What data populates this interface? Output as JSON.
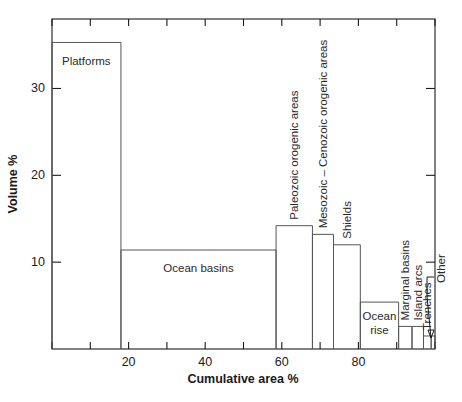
{
  "chart_data": {
    "type": "bar",
    "title": "",
    "xlabel": "Cumulative area %",
    "ylabel": "Volume %",
    "xlim": [
      0,
      100
    ],
    "ylim": [
      0,
      38
    ],
    "xticks": [
      0,
      10,
      20,
      30,
      40,
      50,
      60,
      70,
      80,
      90,
      100
    ],
    "xtick_labels": [
      "",
      "",
      "20",
      "",
      "40",
      "",
      "60",
      "",
      "80",
      "",
      ""
    ],
    "yticks": [
      10,
      20,
      30
    ],
    "ytick_labels": [
      "10",
      "20",
      "30"
    ],
    "grid": false,
    "legend": "none",
    "note": "Step histogram: bar width = cumulative area span, bar height = volume %",
    "bars": [
      {
        "label": "Platforms",
        "x_start": 0.0,
        "x_end": 18.0,
        "value": 35.3,
        "label_mode": "inside-horizontal"
      },
      {
        "label": "Ocean basins",
        "x_start": 18.0,
        "x_end": 58.5,
        "value": 11.4,
        "label_mode": "inside-horizontal"
      },
      {
        "label": "Paleozoic orogenic areas",
        "x_start": 58.5,
        "x_end": 68.0,
        "value": 14.2,
        "label_mode": "above-vertical"
      },
      {
        "label": "Mesozoic – Cenozoic orogenic areas",
        "x_start": 68.0,
        "x_end": 73.5,
        "value": 13.2,
        "label_mode": "above-vertical"
      },
      {
        "label": "Shields",
        "x_start": 73.5,
        "x_end": 80.5,
        "value": 12.0,
        "label_mode": "above-vertical"
      },
      {
        "label": "Ocean rise",
        "x_start": 80.5,
        "x_end": 90.5,
        "value": 5.4,
        "label_mode": "inside-horizontal"
      },
      {
        "label": "Marginal basins",
        "x_start": 90.5,
        "x_end": 94.0,
        "value": 2.6,
        "label_mode": "above-vertical"
      },
      {
        "label": "Island arcs",
        "x_start": 94.0,
        "x_end": 97.0,
        "value": 2.6,
        "label_mode": "above-vertical"
      },
      {
        "label": "Trenches",
        "x_start": 97.0,
        "x_end": 99.0,
        "value": 1.5,
        "label_mode": "above-vertical"
      },
      {
        "label": "Other",
        "x_start": 99.0,
        "x_end": 100.0,
        "value": 1.5,
        "label_mode": "leader-vertical"
      }
    ]
  },
  "colors": {
    "axis": "#1a1a1a",
    "bar_stroke": "#555555",
    "background": "#ffffff",
    "text": "#1a1a1a"
  }
}
